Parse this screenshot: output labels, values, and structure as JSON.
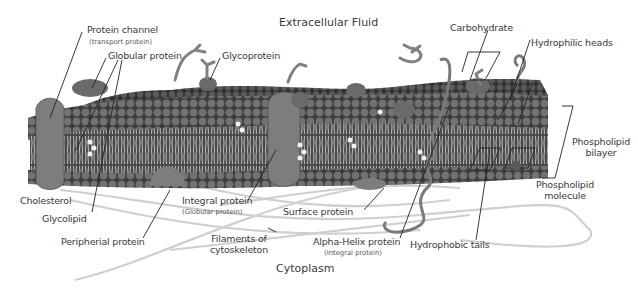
{
  "diagram": {
    "title_top": "Extracellular Fluid",
    "title_bottom": "Cytoplasm",
    "colors": {
      "membrane_dark": "#4a4a4a",
      "head_mid": "#6e6e6e",
      "protein": "#7a7a7a",
      "tail": "#d8d8d8",
      "filament": "#cfcfcf",
      "line": "#222222",
      "background": "#ffffff"
    },
    "labels": {
      "protein_channel": "Protein channel",
      "protein_channel_sub": "(transport protein)",
      "globular_protein": "Globular protein",
      "glycoprotein": "Glycoprotein",
      "carbohydrate": "Carbohydrate",
      "hydrophilic_heads": "Hydrophilic heads",
      "phospholipid_bilayer_1": "Phospholipid",
      "phospholipid_bilayer_2": "bilayer",
      "phospholipid_molecule_1": "Phospholipid",
      "phospholipid_molecule_2": "molecule",
      "cholesterol": "Cholesterol",
      "glycolipid": "Glycolipid",
      "peripheral_protein": "Peripherial protein",
      "integral_protein": "Integral protein",
      "integral_protein_sub": "(Globular protein)",
      "surface_protein": "Surface protein",
      "filaments_1": "Filaments of",
      "filaments_2": "cytoskeleton",
      "alpha_helix": "Alpha-Helix protein",
      "alpha_helix_sub": "(Integral protein)",
      "hydrophobic_tails": "Hydrophobic tails"
    }
  }
}
